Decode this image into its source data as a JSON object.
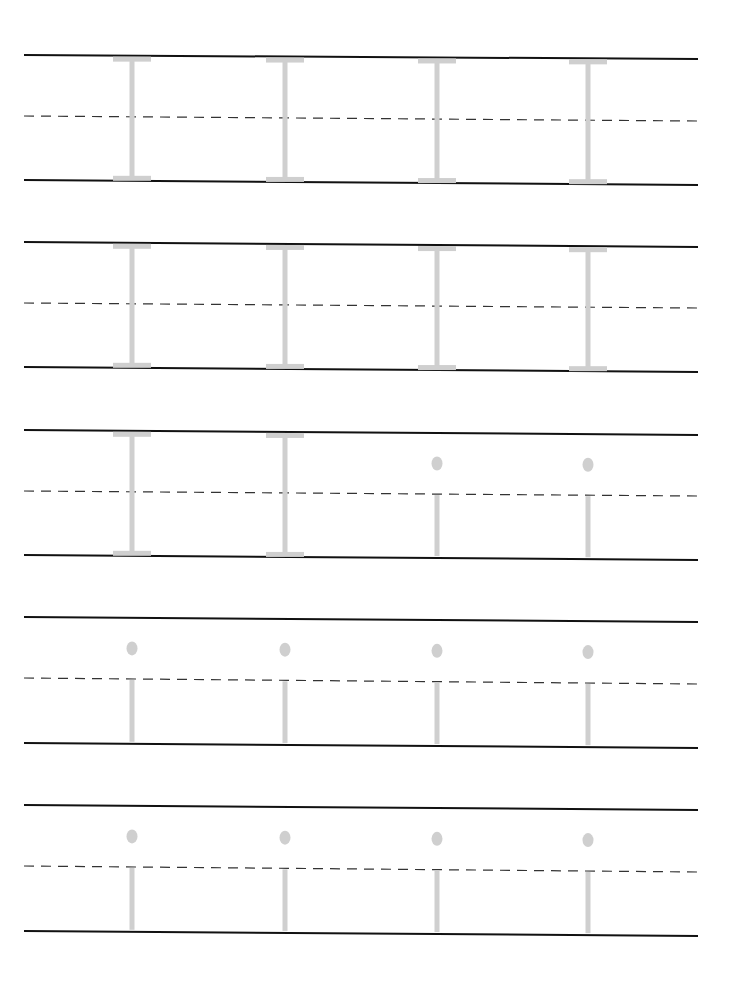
{
  "worksheet": {
    "title": "Letter I handwriting practice",
    "colors": {
      "line": "#111111",
      "dash": "#333333",
      "trace": "#cfcfcf"
    },
    "rows": [
      {
        "top": [
          24,
          55,
          698,
          59
        ],
        "mid": [
          24,
          116,
          698,
          121
        ],
        "bot": [
          24,
          180,
          698,
          185
        ],
        "letters": [
          {
            "x": 132,
            "type": "I"
          },
          {
            "x": 285,
            "type": "I"
          },
          {
            "x": 437,
            "type": "I"
          },
          {
            "x": 588,
            "type": "I"
          }
        ]
      },
      {
        "top": [
          24,
          242,
          698,
          247
        ],
        "mid": [
          24,
          303,
          698,
          308
        ],
        "bot": [
          24,
          367,
          698,
          372
        ],
        "letters": [
          {
            "x": 132,
            "type": "I"
          },
          {
            "x": 285,
            "type": "I"
          },
          {
            "x": 437,
            "type": "I"
          },
          {
            "x": 588,
            "type": "I"
          }
        ]
      },
      {
        "top": [
          24,
          430,
          698,
          435
        ],
        "mid": [
          24,
          491,
          698,
          496
        ],
        "bot": [
          24,
          555,
          698,
          560
        ],
        "letters": [
          {
            "x": 132,
            "type": "I"
          },
          {
            "x": 285,
            "type": "I"
          },
          {
            "x": 437,
            "type": "i"
          },
          {
            "x": 588,
            "type": "i"
          }
        ]
      },
      {
        "top": [
          24,
          617,
          698,
          622
        ],
        "mid": [
          24,
          678,
          698,
          684
        ],
        "bot": [
          24,
          743,
          698,
          748
        ],
        "letters": [
          {
            "x": 132,
            "type": "i"
          },
          {
            "x": 285,
            "type": "i"
          },
          {
            "x": 437,
            "type": "i"
          },
          {
            "x": 588,
            "type": "i"
          }
        ]
      },
      {
        "top": [
          24,
          805,
          698,
          810
        ],
        "mid": [
          24,
          866,
          698,
          872
        ],
        "bot": [
          24,
          931,
          698,
          936
        ],
        "letters": [
          {
            "x": 132,
            "type": "i"
          },
          {
            "x": 285,
            "type": "i"
          },
          {
            "x": 437,
            "type": "i"
          },
          {
            "x": 588,
            "type": "i"
          }
        ]
      }
    ]
  }
}
